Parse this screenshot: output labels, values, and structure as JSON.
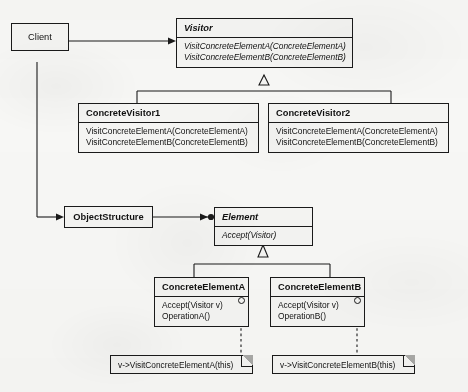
{
  "diagram": {
    "stroke_color": "#1a1a1a",
    "box_fill": "#f4f4f2",
    "background": "#f7f7f5"
  },
  "client": {
    "label": "Client"
  },
  "visitor": {
    "name": "Visitor",
    "operations": [
      "VisitConcreteElementA(ConcreteElementA)",
      "VisitConcreteElementB(ConcreteElementB)"
    ]
  },
  "concrete_visitor1": {
    "name": "ConcreteVisitor1",
    "operations": [
      "VisitConcreteElementA(ConcreteElementA)",
      "VisitConcreteElementB(ConcreteElementB)"
    ]
  },
  "concrete_visitor2": {
    "name": "ConcreteVisitor2",
    "operations": [
      "VisitConcreteElementA(ConcreteElementA)",
      "VisitConcreteElementB(ConcreteElementB)"
    ]
  },
  "object_structure": {
    "label": "ObjectStructure"
  },
  "element": {
    "name": "Element",
    "operations": [
      "Accept(Visitor)"
    ]
  },
  "concrete_element_a": {
    "name": "ConcreteElementA",
    "operations": [
      "Accept(Visitor v)",
      "OperationA()"
    ]
  },
  "concrete_element_b": {
    "name": "ConcreteElementB",
    "operations": [
      "Accept(Visitor v)",
      "OperationB()"
    ]
  },
  "note_a": {
    "text": "v->VisitConcreteElementA(this)"
  },
  "note_b": {
    "text": "v->VisitConcreteElementB(this)"
  }
}
